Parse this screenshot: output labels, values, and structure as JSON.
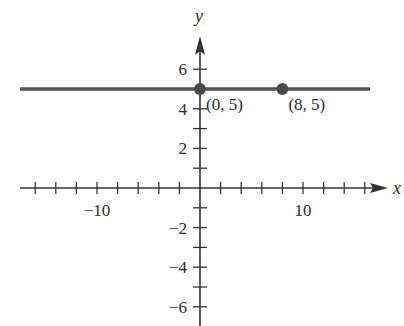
{
  "chart_data": {
    "type": "line",
    "title": "",
    "xlabel": "x",
    "ylabel": "y",
    "xlim": [
      -16.5,
      17
    ],
    "ylim": [
      -7,
      7.5
    ],
    "grid": false,
    "x_ticks": [
      -16,
      -14,
      -12,
      -10,
      -8,
      -6,
      -4,
      -2,
      2,
      4,
      6,
      8,
      10,
      12,
      14,
      16
    ],
    "x_tick_labels": [
      {
        "value": -10,
        "text": "−10"
      },
      {
        "value": 10,
        "text": "10"
      }
    ],
    "y_ticks": [
      -6,
      -5,
      -4,
      -3,
      -2,
      -1,
      1,
      2,
      3,
      4,
      5,
      6
    ],
    "y_tick_labels": [
      {
        "value": 6,
        "text": "6"
      },
      {
        "value": 4,
        "text": "4"
      },
      {
        "value": 2,
        "text": "2"
      },
      {
        "value": -2,
        "text": "−2"
      },
      {
        "value": -4,
        "text": "−4"
      },
      {
        "value": -6,
        "text": "−6"
      }
    ],
    "series": [
      {
        "name": "y = 5",
        "x": [
          -17.5,
          16.5
        ],
        "y": [
          5,
          5
        ],
        "color": "#555555"
      }
    ],
    "points": [
      {
        "x": 0,
        "y": 5,
        "label": "(0, 5)"
      },
      {
        "x": 8,
        "y": 5,
        "label": "(8, 5)"
      }
    ]
  }
}
